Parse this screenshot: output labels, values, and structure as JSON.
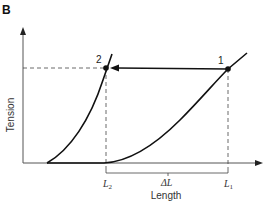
{
  "figure": {
    "panel_label": "B",
    "y_axis_label": "Tension",
    "x_axis_label": "Length",
    "points": [
      {
        "id": "point-1",
        "label": "1"
      },
      {
        "id": "point-2",
        "label": "2"
      }
    ],
    "x_markers": {
      "l2": {
        "base": "L",
        "sub": "2"
      },
      "delta_l": "ΔL",
      "l1": {
        "base": "L",
        "sub": "1"
      }
    },
    "colors": {
      "line": "#111111",
      "axis": "#555555",
      "dashed": "#444444"
    }
  }
}
